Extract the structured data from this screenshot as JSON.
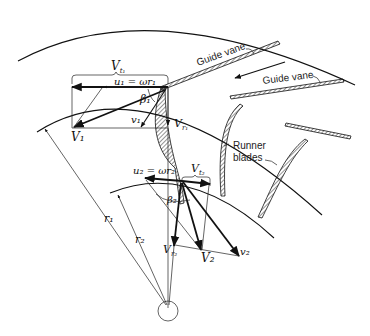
{
  "figure": {
    "type": "diagram"
  },
  "labels": {
    "guide_vane_1": "Guide vane",
    "guide_vane_2": "Guide vane",
    "runner_blades_line1": "Runner",
    "runner_blades_line2": "blades",
    "Vt1": "V",
    "Vt1_sub": "t₁",
    "u1_eq": "u₁ = ωr₁",
    "beta1": "β₁",
    "V1": "V₁",
    "v1": "v₁",
    "Vr1": "V",
    "Vr1_sub": "r₁",
    "u2_eq": "u₂ = ωr₂",
    "Vt2": "V",
    "Vt2_sub": "t₂",
    "beta2": "β₂",
    "Vr2": "V",
    "Vr2_sub": "r₂",
    "V2": "V₂",
    "v2": "v₂",
    "r1": "r₁",
    "r2": "r₂"
  },
  "colors": {
    "ink": "#111111",
    "background": "#ffffff"
  }
}
